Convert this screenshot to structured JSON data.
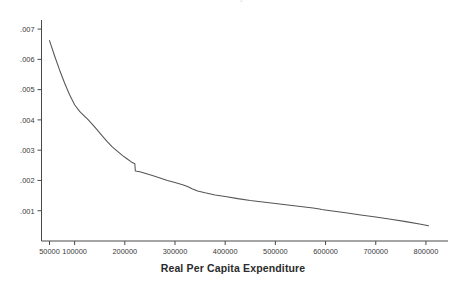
{
  "figure": {
    "title_cut_off": "Kernel Density Estimate",
    "xaxis_title": "Real Per Capita Expenditure"
  },
  "axes": {
    "y_ticks": [
      ".007",
      ".006",
      ".005",
      ".004",
      ".003",
      ".002",
      ".001"
    ],
    "x_ticks": [
      "50000",
      "100000",
      "200000",
      "300000",
      "400000",
      "500000",
      "600000",
      "700000",
      "800000"
    ]
  },
  "colors": {
    "line": "#555555",
    "axis": "#4a4a4a",
    "text": "#2b2b2b",
    "background": "#ffffff"
  },
  "chart_data": {
    "type": "line",
    "title": "",
    "xlabel": "Real Per Capita Expenditure",
    "ylabel": "",
    "xlim": [
      40000,
      830000
    ],
    "ylim": [
      0.0,
      0.0073
    ],
    "grid": false,
    "legend": "none",
    "x_tick_values": [
      50000,
      100000,
      200000,
      300000,
      400000,
      500000,
      600000,
      700000,
      800000
    ],
    "y_tick_values": [
      0.001,
      0.002,
      0.003,
      0.004,
      0.005,
      0.006,
      0.007
    ],
    "annotations": [
      "monotonically decreasing curve",
      "discontinuous step-down near x = 220000 from about .00255 to about .00230",
      "small kink near x = 340000",
      "small blip near x = 590000"
    ],
    "series": [
      {
        "name": "density",
        "x": [
          50000,
          60000,
          70000,
          80000,
          90000,
          100000,
          110000,
          120000,
          125000,
          135000,
          145000,
          155000,
          165000,
          175000,
          185000,
          195000,
          205000,
          215000,
          219000,
          220000,
          221000,
          230000,
          240000,
          255000,
          270000,
          285000,
          300000,
          315000,
          325000,
          335000,
          345000,
          360000,
          380000,
          400000,
          425000,
          450000,
          475000,
          500000,
          525000,
          550000,
          575000,
          588000,
          592000,
          610000,
          640000,
          670000,
          700000,
          730000,
          760000,
          790000,
          805000
        ],
        "y": [
          0.00662,
          0.00612,
          0.00565,
          0.00522,
          0.00483,
          0.0045,
          0.00428,
          0.00412,
          0.00404,
          0.00386,
          0.00367,
          0.00347,
          0.00328,
          0.00311,
          0.00297,
          0.00283,
          0.00271,
          0.00259,
          0.00256,
          0.00255,
          0.00231,
          0.00229,
          0.00224,
          0.00216,
          0.00208,
          0.002,
          0.00193,
          0.00186,
          0.0018,
          0.00172,
          0.00165,
          0.00159,
          0.00152,
          0.00147,
          0.0014,
          0.00134,
          0.00129,
          0.00124,
          0.00119,
          0.00114,
          0.00109,
          0.00106,
          0.00104,
          0.001,
          0.00093,
          0.00086,
          0.00079,
          0.00072,
          0.00064,
          0.00055,
          0.0005
        ]
      }
    ]
  }
}
